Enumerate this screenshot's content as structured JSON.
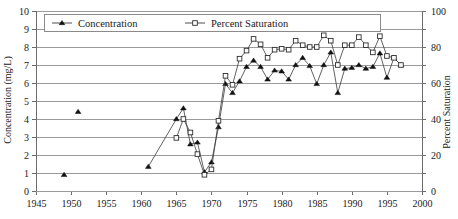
{
  "chart_data": {
    "type": "line",
    "title": "",
    "xlabel": "",
    "ylabel": "Concentration (mg/L)",
    "y2label": "Percent Saturation",
    "xlim": [
      1945,
      2000
    ],
    "ylim": [
      0,
      10
    ],
    "y2lim": [
      0,
      100
    ],
    "grid": true,
    "legend_position": "top-inside",
    "x_ticks": [
      1945,
      1950,
      1955,
      1960,
      1965,
      1970,
      1975,
      1980,
      1985,
      1990,
      1995,
      2000
    ],
    "y_ticks": [
      0,
      1,
      2,
      3,
      4,
      5,
      6,
      7,
      8,
      9,
      10
    ],
    "y2_ticks": [
      0,
      20,
      40,
      60,
      80,
      100
    ],
    "series": [
      {
        "name": "Concentration",
        "axis": "left",
        "marker": "filled-triangle",
        "units": "mg/L",
        "points": [
          [
            1949,
            0.9
          ],
          [
            1951,
            4.4
          ],
          [
            1961,
            1.35
          ],
          [
            1965,
            4.0
          ],
          [
            1966,
            4.6
          ],
          [
            1967,
            2.6
          ],
          [
            1968,
            2.7
          ],
          [
            1969,
            1.05
          ],
          [
            1970,
            1.6
          ],
          [
            1971,
            3.55
          ],
          [
            1972,
            5.95
          ],
          [
            1973,
            5.45
          ],
          [
            1974,
            6.1
          ],
          [
            1975,
            6.9
          ],
          [
            1976,
            7.25
          ],
          [
            1977,
            6.9
          ],
          [
            1978,
            6.2
          ],
          [
            1979,
            6.7
          ],
          [
            1980,
            6.65
          ],
          [
            1981,
            6.2
          ],
          [
            1982,
            7.0
          ],
          [
            1983,
            7.4
          ],
          [
            1984,
            6.95
          ],
          [
            1985,
            5.95
          ],
          [
            1986,
            7.0
          ],
          [
            1987,
            7.7
          ],
          [
            1988,
            5.45
          ],
          [
            1989,
            6.8
          ],
          [
            1990,
            6.85
          ],
          [
            1991,
            7.0
          ],
          [
            1992,
            6.8
          ],
          [
            1993,
            6.9
          ],
          [
            1994,
            7.65
          ],
          [
            1995,
            6.3
          ],
          [
            1996,
            7.4
          ],
          [
            1997,
            7.0
          ]
        ]
      },
      {
        "name": "Percent Saturation",
        "axis": "right",
        "marker": "open-square",
        "units": "%",
        "points": [
          [
            1965,
            29.5
          ],
          [
            1966,
            40.0
          ],
          [
            1967,
            32.5
          ],
          [
            1968,
            20.5
          ],
          [
            1969,
            9.0
          ],
          [
            1970,
            12.0
          ],
          [
            1971,
            39.0
          ],
          [
            1972,
            64.0
          ],
          [
            1973,
            59.0
          ],
          [
            1974,
            73.5
          ],
          [
            1975,
            78.0
          ],
          [
            1976,
            84.5
          ],
          [
            1977,
            81.5
          ],
          [
            1978,
            74.0
          ],
          [
            1979,
            78.5
          ],
          [
            1980,
            79.0
          ],
          [
            1981,
            78.5
          ],
          [
            1982,
            83.5
          ],
          [
            1983,
            81.0
          ],
          [
            1984,
            80.0
          ],
          [
            1985,
            80.0
          ],
          [
            1986,
            86.5
          ],
          [
            1987,
            83.5
          ],
          [
            1988,
            70.0
          ],
          [
            1989,
            81.0
          ],
          [
            1990,
            81.0
          ],
          [
            1991,
            85.5
          ],
          [
            1992,
            81.0
          ],
          [
            1993,
            77.0
          ],
          [
            1994,
            86.0
          ],
          [
            1995,
            75.0
          ],
          [
            1996,
            74.0
          ],
          [
            1997,
            70.0
          ]
        ]
      }
    ]
  },
  "legend": {
    "items": [
      {
        "label": "Concentration"
      },
      {
        "label": "Percent Saturation"
      }
    ]
  },
  "axes": {
    "left_title": "Concentration (mg/L)",
    "right_title": "Percent Saturation"
  }
}
